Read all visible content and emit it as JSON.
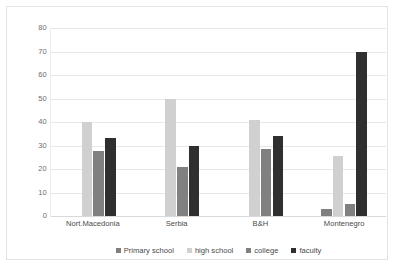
{
  "chart_data": {
    "type": "bar",
    "title": "",
    "xlabel": "",
    "ylabel": "",
    "ylim": [
      0,
      80
    ],
    "yticks": [
      0,
      10,
      20,
      30,
      40,
      50,
      60,
      70,
      80
    ],
    "grid": true,
    "legend_position": "bottom",
    "categories": [
      "Nort.Macedonia",
      "Serbia",
      "B&H",
      "Montenegro"
    ],
    "series": [
      {
        "name": "Primary school",
        "color": "#7f7f7f",
        "values": [
          0,
          0,
          0,
          3
        ]
      },
      {
        "name": "high school",
        "color": "#d0d0d0",
        "values": [
          40,
          50,
          41,
          25.5
        ]
      },
      {
        "name": "college",
        "color": "#808080",
        "values": [
          27.5,
          21,
          28.5,
          5
        ]
      },
      {
        "name": "faculty",
        "color": "#2f2f2f",
        "values": [
          33,
          30,
          34,
          70
        ]
      }
    ]
  },
  "axis": {
    "y_tick_labels": [
      "80",
      "70",
      "60",
      "50",
      "40",
      "30",
      "20",
      "10",
      "0"
    ]
  },
  "legend": {
    "items": [
      {
        "label": "Primary school",
        "color": "#7f7f7f"
      },
      {
        "label": "high school",
        "color": "#d0d0d0"
      },
      {
        "label": "college",
        "color": "#808080"
      },
      {
        "label": "faculty",
        "color": "#2f2f2f"
      }
    ]
  },
  "colors": {
    "background": "#ffffff",
    "frame_border": "#e3e3e3",
    "gridline": "#e8e8e8",
    "tick_text": "#6e6e6e",
    "label_text": "#4a4a4a"
  }
}
